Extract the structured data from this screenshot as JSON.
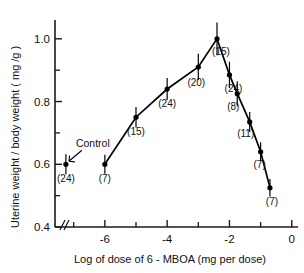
{
  "chart_data": {
    "type": "line",
    "title": "",
    "xlabel": "Log of dose of 6 - MBOA (mg per dose)",
    "ylabel": "Uterine weight / body weight ( mg /g )",
    "xlim": [
      -7.6,
      0.2
    ],
    "ylim": [
      0.4,
      1.06
    ],
    "xticks": [
      "-6",
      "-4",
      "-2",
      "0"
    ],
    "xtick_values": [
      -6,
      -4,
      -2,
      0
    ],
    "yticks": [
      "1.0",
      "0.8",
      "0.6",
      "0.4"
    ],
    "ytick_values": [
      1.0,
      0.8,
      0.6,
      0.4
    ],
    "grid": false,
    "legend": "none",
    "axis_break": "x-axis broken just right of origin (//)",
    "control": {
      "label": "Control",
      "x": -7.25,
      "value": 0.6,
      "n_label": "(24)",
      "n": 24,
      "error": 0.022
    },
    "series": [
      {
        "name": "Uterine weight / body weight",
        "points": [
          {
            "x": -6.0,
            "y": 0.6,
            "n": 7,
            "n_label": "(7)",
            "error": 0.03
          },
          {
            "x": -5.0,
            "y": 0.75,
            "n": 15,
            "n_label": "(15)",
            "error": 0.033
          },
          {
            "x": -4.0,
            "y": 0.84,
            "n": 24,
            "n_label": "(24)",
            "error": 0.035
          },
          {
            "x": -3.0,
            "y": 0.91,
            "n": 20,
            "n_label": "(20)",
            "error": 0.042
          },
          {
            "x": -2.4,
            "y": 1.0,
            "n": 15,
            "n_label": "(15)",
            "error": 0.052
          },
          {
            "x": -2.0,
            "y": 0.885,
            "n": 24,
            "n_label": "(24)",
            "error": 0.042
          },
          {
            "x": -1.75,
            "y": 0.825,
            "n": 8,
            "n_label": "(8)",
            "error": 0.04
          },
          {
            "x": -1.35,
            "y": 0.735,
            "n": 11,
            "n_label": "(11)",
            "error": 0.032
          },
          {
            "x": -1.0,
            "y": 0.64,
            "n": 7,
            "n_label": "(7)",
            "error": 0.03
          },
          {
            "x": -0.7,
            "y": 0.525,
            "n": 7,
            "n_label": "(7)",
            "error": 0.028
          }
        ]
      }
    ]
  },
  "colors": {
    "axis": "#1a1a1a",
    "marker": "#000000",
    "line": "#000000",
    "background": "#ffffff"
  }
}
